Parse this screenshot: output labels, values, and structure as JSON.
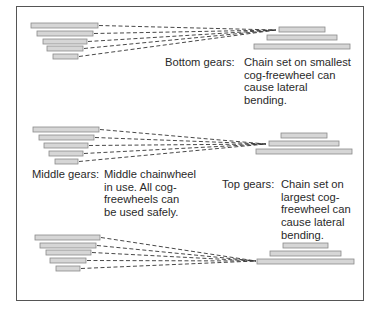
{
  "colors": {
    "bar_fill": "#d6d6d6",
    "bar_stroke": "#8a8a8a",
    "chain_line": "#333333",
    "border": "#555555",
    "text": "#2a2a2a"
  },
  "panels": [
    {
      "id": "bottom",
      "label": "Bottom gears:",
      "description_lines": [
        "Chain set on smallest",
        "cog-freewheel can",
        "cause lateral",
        "bending."
      ],
      "chainwheels": [
        {
          "x1": 31,
          "x2": 98,
          "y": 23
        },
        {
          "x1": 37,
          "x2": 93,
          "y": 31
        },
        {
          "x1": 43,
          "x2": 87,
          "y": 39
        },
        {
          "x1": 47,
          "x2": 83,
          "y": 46
        },
        {
          "x1": 53,
          "x2": 78,
          "y": 54
        }
      ],
      "cogs": [
        {
          "x1": 279,
          "x2": 325,
          "y": 27
        },
        {
          "x1": 267,
          "x2": 337,
          "y": 35
        },
        {
          "x1": 254,
          "x2": 350,
          "y": 44
        }
      ],
      "converge": {
        "x": 276,
        "y": 30
      }
    },
    {
      "id": "middle",
      "label": "Middle gears:",
      "description_lines": [
        "Middle chainwheel",
        "in use. All cog-",
        "freewheels can",
        "be used safely."
      ],
      "chainwheels": [
        {
          "x1": 33,
          "x2": 99,
          "y": 127
        },
        {
          "x1": 39,
          "x2": 94,
          "y": 135
        },
        {
          "x1": 44,
          "x2": 88,
          "y": 143
        },
        {
          "x1": 49,
          "x2": 83,
          "y": 151
        },
        {
          "x1": 55,
          "x2": 78,
          "y": 159
        }
      ],
      "cogs": [
        {
          "x1": 281,
          "x2": 327,
          "y": 133
        },
        {
          "x1": 269,
          "x2": 339,
          "y": 141
        },
        {
          "x1": 256,
          "x2": 352,
          "y": 149
        }
      ],
      "converge": {
        "x": 266,
        "y": 144
      }
    },
    {
      "id": "top",
      "label": "Top gears:",
      "description_lines": [
        "Chain set on",
        "largest cog-",
        "freewheel can",
        "cause lateral",
        "bending."
      ],
      "chainwheels": [
        {
          "x1": 35,
          "x2": 100,
          "y": 235
        },
        {
          "x1": 40,
          "x2": 96,
          "y": 243
        },
        {
          "x1": 46,
          "x2": 91,
          "y": 250
        },
        {
          "x1": 50,
          "x2": 86,
          "y": 258
        },
        {
          "x1": 56,
          "x2": 80,
          "y": 266
        }
      ],
      "cogs": [
        {
          "x1": 283,
          "x2": 328,
          "y": 243
        },
        {
          "x1": 270,
          "x2": 341,
          "y": 251
        },
        {
          "x1": 257,
          "x2": 354,
          "y": 259
        }
      ],
      "converge": {
        "x": 256,
        "y": 261
      }
    }
  ]
}
